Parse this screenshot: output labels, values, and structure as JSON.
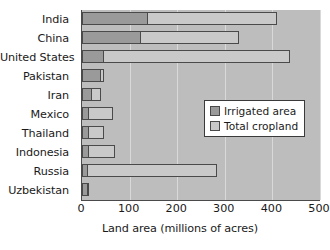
{
  "chart_data": {
    "type": "bar",
    "orientation": "horizontal",
    "title": "",
    "xlabel": "Land area (millions of acres)",
    "ylabel": "",
    "xlim": [
      0,
      500
    ],
    "xticks": [
      0,
      100,
      200,
      300,
      400,
      500
    ],
    "grid": true,
    "legend_position": "center-right",
    "categories": [
      "India",
      "China",
      "United States",
      "Pakistan",
      "Iran",
      "Mexico",
      "Thailand",
      "Indonesia",
      "Russia",
      "Uzbekistan"
    ],
    "series": [
      {
        "name": "Irrigated area",
        "color": "#9a9a9a",
        "values": [
          138,
          123,
          47,
          40,
          20,
          14,
          14,
          14,
          12,
          12
        ]
      },
      {
        "name": "Total cropland",
        "color": "#c9c9c9",
        "values": [
          409,
          330,
          438,
          47,
          40,
          66,
          47,
          70,
          283,
          15
        ]
      }
    ]
  },
  "axes": {
    "x_tick_labels": [
      "0",
      "100",
      "200",
      "300",
      "400",
      "500"
    ],
    "x_title": "Land area (millions of acres)"
  },
  "legend": {
    "entries": [
      {
        "label": "Irrigated area",
        "swatch": "swatch-irrigated"
      },
      {
        "label": "Total cropland",
        "swatch": "swatch-total"
      }
    ]
  },
  "colors": {
    "plot_background": "#bdbdbd",
    "gridline": "#d9d9d9",
    "bar_outline": "#4a4a4a",
    "irrigated": "#9a9a9a",
    "total_cropland": "#c9c9c9",
    "text": "#1a1a1a"
  }
}
